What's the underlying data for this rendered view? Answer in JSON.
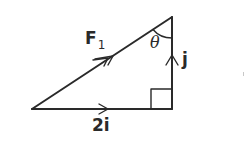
{
  "diagram": {
    "type": "vector-triangle",
    "stroke_color": "#2a2a2a",
    "vertices": {
      "bottom_left": [
        32,
        109
      ],
      "bottom_right": [
        172,
        109
      ],
      "top": [
        172,
        17
      ]
    },
    "sides": [
      {
        "name": "hypotenuse",
        "vector": "F1",
        "arrow": "double",
        "direction": "bottom-left to top"
      },
      {
        "name": "base",
        "vector": "2i",
        "arrow": "single",
        "direction": "left to right"
      },
      {
        "name": "vertical",
        "vector": "j",
        "arrow": "single",
        "direction": "bottom to top"
      }
    ],
    "right_angle_at": "bottom_right",
    "angle_marked_at": "top"
  },
  "labels": {
    "f1_main": "F",
    "f1_sub": "1",
    "theta": "θ",
    "j": "j",
    "base": "2i"
  }
}
